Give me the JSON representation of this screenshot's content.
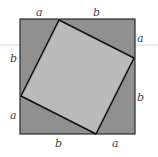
{
  "diagram": {
    "colors": {
      "outer_fill": "#909090",
      "inner_fill": "#bababa",
      "stroke": "#1a1a1a",
      "label": "#444444",
      "artifact_line": "#cfcfcf"
    },
    "outer_square": {
      "x": 20,
      "y": 19,
      "size": 115
    },
    "inner_square": {
      "points": "59,20 134,58 96,134 21,96"
    },
    "labels": {
      "top_a": "a",
      "top_b": "b",
      "right_a": "a",
      "right_b": "b",
      "bottom_b": "b",
      "bottom_a": "a",
      "left_b": "b",
      "left_a": "a"
    }
  }
}
